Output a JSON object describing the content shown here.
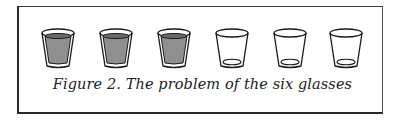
{
  "figure": {
    "caption": "Figure 2.  The problem of the six glasses",
    "glasses": [
      {
        "state": "full"
      },
      {
        "state": "full"
      },
      {
        "state": "full"
      },
      {
        "state": "empty"
      },
      {
        "state": "empty"
      },
      {
        "state": "empty"
      }
    ],
    "colors": {
      "liquid": "#8f8f8f",
      "outline": "#1a1a1a",
      "border": "#2a2a2a"
    }
  }
}
